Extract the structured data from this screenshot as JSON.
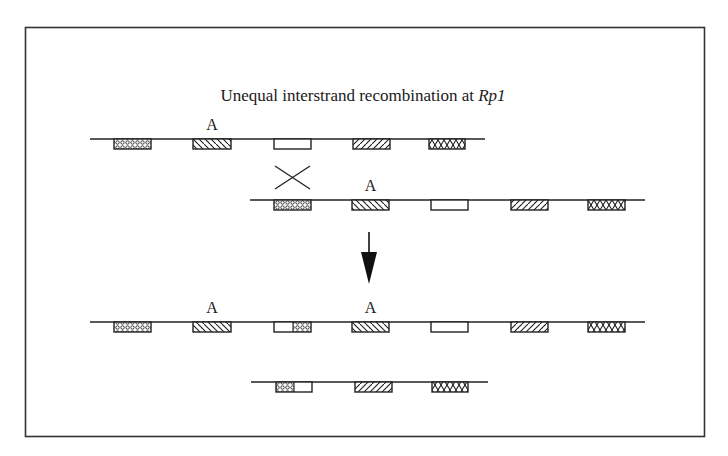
{
  "title": {
    "prefix": "Unequal interstrand recombination at ",
    "gene": "Rp1"
  },
  "patterns": {
    "dots": "dotted",
    "back": "back-diagonal hatch",
    "empty": "open",
    "fwd": "forward-diagonal hatch",
    "cross": "crosshatch"
  },
  "label_A": "A",
  "strands": [
    {
      "id": "parent-strand-1",
      "line": [
        90,
        485
      ],
      "y": 139,
      "genes": [
        {
          "x": 114,
          "w": 37,
          "p": "dots"
        },
        {
          "x": 193,
          "w": 38,
          "p": "back",
          "label": "A"
        },
        {
          "x": 274,
          "w": 37,
          "p": "empty"
        },
        {
          "x": 353,
          "w": 37,
          "p": "fwd"
        },
        {
          "x": 429,
          "w": 36,
          "p": "cross"
        }
      ]
    },
    {
      "id": "parent-strand-2",
      "line": [
        250,
        645
      ],
      "y": 200,
      "genes": [
        {
          "x": 274,
          "w": 37,
          "p": "dots"
        },
        {
          "x": 352,
          "w": 37,
          "p": "back",
          "label": "A"
        },
        {
          "x": 431,
          "w": 37,
          "p": "empty"
        },
        {
          "x": 511,
          "w": 37,
          "p": "fwd"
        },
        {
          "x": 588,
          "w": 37,
          "p": "cross"
        }
      ]
    },
    {
      "id": "product-strand-long",
      "line": [
        90,
        645
      ],
      "y": 322,
      "genes": [
        {
          "x": 114,
          "w": 37,
          "p": "dots"
        },
        {
          "x": 193,
          "w": 38,
          "p": "back",
          "label": "A"
        },
        {
          "x": 274,
          "w": 37,
          "p": "chimera-empty-dots"
        },
        {
          "x": 352,
          "w": 37,
          "p": "back",
          "label": "A"
        },
        {
          "x": 431,
          "w": 37,
          "p": "empty"
        },
        {
          "x": 511,
          "w": 37,
          "p": "fwd"
        },
        {
          "x": 588,
          "w": 37,
          "p": "cross"
        }
      ]
    },
    {
      "id": "product-strand-short",
      "line": [
        251,
        488
      ],
      "y": 382,
      "genes": [
        {
          "x": 276,
          "w": 36,
          "p": "chimera-dots-empty"
        },
        {
          "x": 355,
          "w": 37,
          "p": "fwd"
        },
        {
          "x": 432,
          "w": 36,
          "p": "cross"
        }
      ]
    }
  ],
  "crossover": {
    "x1": 275,
    "x2": 310,
    "y1": 166,
    "y2": 189
  },
  "arrow": {
    "x": 369,
    "y1": 232,
    "y2": 284
  }
}
